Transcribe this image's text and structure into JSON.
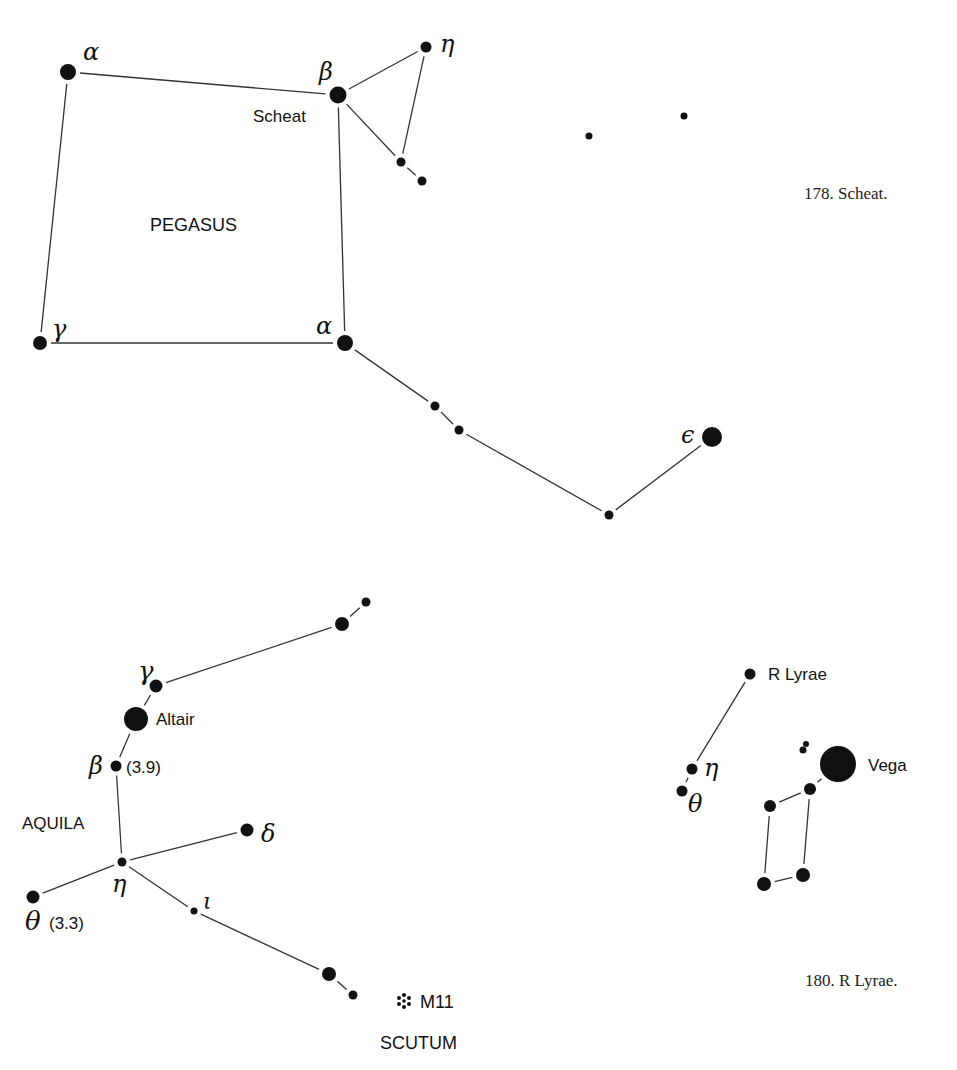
{
  "pegasus": {
    "constellation_label": "PEGASUS",
    "caption": "178. Scheat.",
    "stars": [
      {
        "id": "alpha-nw",
        "greek": "α",
        "x": 68,
        "y": 72,
        "r": 8
      },
      {
        "id": "beta",
        "greek": "β",
        "name": "Scheat",
        "x": 338,
        "y": 95,
        "r": 8.5
      },
      {
        "id": "eta",
        "greek": "η",
        "x": 426,
        "y": 47,
        "r": 5.5
      },
      {
        "id": "pi-1",
        "x": 401,
        "y": 162,
        "r": 4.5
      },
      {
        "id": "pi-2",
        "x": 422,
        "y": 181,
        "r": 4.5
      },
      {
        "id": "gamma",
        "greek": "γ",
        "x": 40,
        "y": 343,
        "r": 7
      },
      {
        "id": "alpha",
        "greek": "α",
        "x": 345,
        "y": 343,
        "r": 8
      },
      {
        "id": "s1",
        "x": 435,
        "y": 406,
        "r": 4.5
      },
      {
        "id": "s2",
        "x": 459,
        "y": 430,
        "r": 4.5
      },
      {
        "id": "s3",
        "x": 609,
        "y": 515,
        "r": 4.5
      },
      {
        "id": "epsilon",
        "greek": "ε",
        "x": 712,
        "y": 437,
        "r": 10
      },
      {
        "id": "f1",
        "x": 589,
        "y": 136,
        "r": 3.5
      },
      {
        "id": "f2",
        "x": 684,
        "y": 116,
        "r": 3.5
      }
    ],
    "lines": [
      [
        "alpha-nw",
        "beta"
      ],
      [
        "alpha-nw",
        "gamma"
      ],
      [
        "beta",
        "eta"
      ],
      [
        "beta",
        "pi-1"
      ],
      [
        "eta",
        "pi-1"
      ],
      [
        "pi-1",
        "pi-2"
      ],
      [
        "beta",
        "alpha"
      ],
      [
        "gamma",
        "alpha"
      ],
      [
        "alpha",
        "s1"
      ],
      [
        "s1",
        "s2"
      ],
      [
        "s2",
        "s3"
      ],
      [
        "s3",
        "epsilon"
      ]
    ]
  },
  "aquila": {
    "constellation_label": "AQUILA",
    "stars": [
      {
        "id": "a1",
        "x": 366,
        "y": 602,
        "r": 4.5
      },
      {
        "id": "a2",
        "x": 342,
        "y": 624,
        "r": 7
      },
      {
        "id": "gamma",
        "greek": "γ",
        "x": 156,
        "y": 686,
        "r": 6.5
      },
      {
        "id": "alpha",
        "name": "Altair",
        "x": 136,
        "y": 719,
        "r": 12
      },
      {
        "id": "beta",
        "greek": "β",
        "magnitude": "(3.9)",
        "x": 116,
        "y": 766,
        "r": 5.5
      },
      {
        "id": "delta",
        "greek": "δ",
        "x": 247,
        "y": 830,
        "r": 6.5
      },
      {
        "id": "eta",
        "greek": "η",
        "x": 122,
        "y": 862,
        "r": 4.5
      },
      {
        "id": "theta",
        "greek": "θ",
        "magnitude": "(3.3)",
        "x": 33,
        "y": 897,
        "r": 6.5
      },
      {
        "id": "iota",
        "greek": "ι",
        "x": 194,
        "y": 911,
        "r": 3.5
      },
      {
        "id": "lambda",
        "x": 329,
        "y": 974,
        "r": 7
      },
      {
        "id": "l2",
        "x": 353,
        "y": 995,
        "r": 4.5
      }
    ],
    "lines": [
      [
        "a1",
        "a2"
      ],
      [
        "a2",
        "gamma"
      ],
      [
        "gamma",
        "alpha"
      ],
      [
        "alpha",
        "beta"
      ],
      [
        "beta",
        "eta"
      ],
      [
        "eta",
        "delta"
      ],
      [
        "eta",
        "theta"
      ],
      [
        "eta",
        "iota"
      ],
      [
        "iota",
        "lambda"
      ],
      [
        "lambda",
        "l2"
      ]
    ]
  },
  "scutum": {
    "constellation_label": "SCUTUM",
    "cluster": {
      "name": "M11",
      "icon": "star-cluster-icon",
      "x": 404,
      "y": 1001
    }
  },
  "lyra": {
    "caption": "180. R Lyrae.",
    "stars": [
      {
        "id": "r-lyrae",
        "name": "R Lyrae",
        "x": 750,
        "y": 674,
        "r": 5.5
      },
      {
        "id": "eta",
        "greek": "η",
        "x": 692,
        "y": 769,
        "r": 5.5
      },
      {
        "id": "theta",
        "greek": "θ",
        "x": 682,
        "y": 791,
        "r": 5.5
      },
      {
        "id": "epsilon",
        "x": 803,
        "y": 750,
        "r": 3.5
      },
      {
        "id": "epsilon-b",
        "x": 806,
        "y": 744,
        "r": 3
      },
      {
        "id": "vega",
        "name": "Vega",
        "x": 838,
        "y": 764,
        "r": 18
      },
      {
        "id": "zeta",
        "x": 810,
        "y": 789,
        "r": 6
      },
      {
        "id": "delta",
        "x": 770,
        "y": 806,
        "r": 6
      },
      {
        "id": "gamma",
        "x": 764,
        "y": 884,
        "r": 7
      },
      {
        "id": "beta",
        "x": 803,
        "y": 875,
        "r": 7
      }
    ],
    "lines": [
      [
        "r-lyrae",
        "eta"
      ],
      [
        "eta",
        "theta"
      ],
      [
        "vega",
        "zeta"
      ],
      [
        "zeta",
        "delta"
      ],
      [
        "delta",
        "gamma"
      ],
      [
        "zeta",
        "beta"
      ],
      [
        "gamma",
        "beta"
      ]
    ]
  },
  "labels": {
    "pegasus_alpha_nw": "α",
    "pegasus_beta": "β",
    "pegasus_scheat": "Scheat",
    "pegasus_eta": "η",
    "pegasus_gamma": "γ",
    "pegasus_alpha": "α",
    "pegasus_epsilon": "ϵ",
    "aquila_gamma": "γ",
    "aquila_altair": "Altair",
    "aquila_beta": "β",
    "aquila_beta_mag": "(3.9)",
    "aquila_delta": "δ",
    "aquila_eta": "η",
    "aquila_theta": "θ",
    "aquila_theta_mag": "(3.3)",
    "aquila_iota": "ι",
    "m11": "M11",
    "lyra_r": "R Lyrae",
    "lyra_eta": "η",
    "lyra_theta": "θ",
    "lyra_vega": "Vega"
  }
}
